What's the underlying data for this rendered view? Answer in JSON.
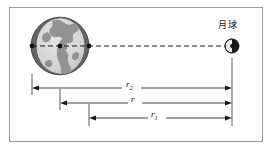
{
  "figure": {
    "kind": "physics-diagram",
    "title_text": "",
    "background_color": "#fdfdfd",
    "border_color": "#9a9a9a",
    "labels": {
      "moon": "月球",
      "dim_r2": "r",
      "dim_r2_sub": "2",
      "dim_r": "r",
      "dim_r1": "r",
      "dim_r1_sub": "1"
    },
    "bodies": {
      "earth": {
        "name": "earth-sphere",
        "cx": 60,
        "cy": 46,
        "r": 29,
        "shadow_color": "#5f5f5f",
        "surface_color": "#d8d8d8",
        "continent_color": "#8e8e8e",
        "outline_color": "#2a2a2a"
      },
      "moon": {
        "name": "moon-sphere",
        "cx": 232,
        "cy": 46,
        "r": 7,
        "light_color": "#e6e6e6",
        "dark_color": "#1c1c1c",
        "outline_color": "#1a1a1a"
      }
    },
    "center_line": {
      "name": "earth-moon-axis",
      "x1": 32,
      "x2": 232,
      "y": 46,
      "style": "dashed",
      "color": "#1a1a1a"
    },
    "markers": [
      {
        "name": "earth-left-edge-point",
        "x": 32,
        "y": 46
      },
      {
        "name": "earth-center-point",
        "x": 60,
        "y": 46
      },
      {
        "name": "earth-right-edge-point",
        "x": 89,
        "y": 46
      },
      {
        "name": "moon-center-point",
        "x": 232,
        "y": 46
      }
    ],
    "dimensions": [
      {
        "name": "dimension-r2",
        "label": "r₂",
        "x_start": 32,
        "x_end": 232,
        "y": 88,
        "tick_top": 74
      },
      {
        "name": "dimension-r",
        "label": "r",
        "x_start": 60,
        "x_end": 232,
        "y": 103,
        "tick_top": 95
      },
      {
        "name": "dimension-r1",
        "label": "r₁",
        "x_start": 89,
        "x_end": 232,
        "y": 118,
        "tick_top": 110
      }
    ],
    "extension_line": {
      "name": "moon-extension-line",
      "x": 232,
      "y_top": 58,
      "y_bottom": 126,
      "color": "#3a3a3a"
    }
  }
}
